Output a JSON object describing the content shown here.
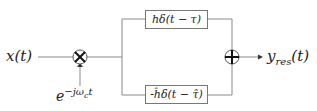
{
  "diagram": {
    "input_label": "x(t)",
    "carrier_label": "e^{-jω_c t}",
    "carrier_base": "e",
    "carrier_exp": "−jω",
    "carrier_sub": "c",
    "carrier_t": "t",
    "upper_block": "hδ(t − τ)",
    "lower_block": "-ĥδ(t − τ̂)",
    "output_label_base": "y",
    "output_label_sub": "res",
    "output_label_arg": "(t)",
    "multiplier_symbol": "⊗",
    "adder_symbol": "⊕",
    "line_color": "#7a7a7a"
  }
}
